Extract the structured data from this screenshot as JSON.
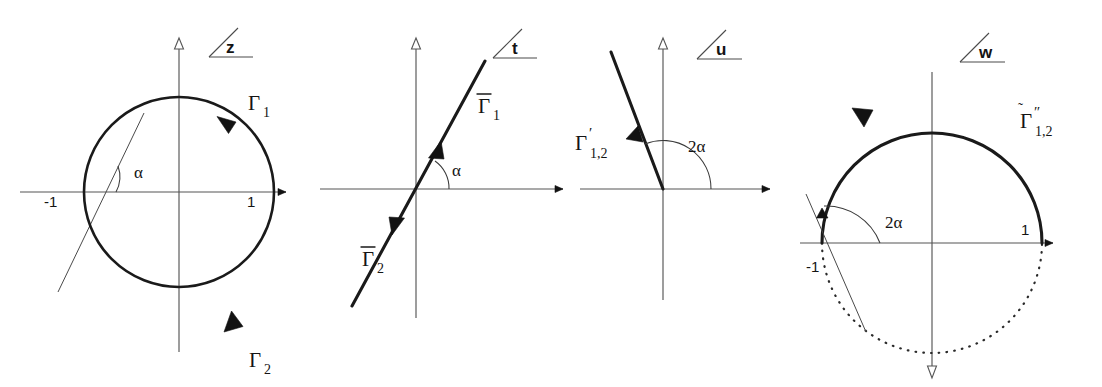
{
  "figure": {
    "background": "#ffffff",
    "ink_color": "#141414",
    "axis_color": "#555555"
  },
  "panels": [
    {
      "id": "z-plane",
      "plane_label": "z",
      "plane_mark": "angle-wedge",
      "geometry": "unit-circle",
      "origin": {
        "x": 179,
        "y": 192
      },
      "radius": 95,
      "axis_points": [
        "-1",
        "1"
      ],
      "angle_label": "α",
      "curves": [
        {
          "name": "Γ",
          "sub": "1",
          "arc": "upper-right",
          "direction": "clockwise"
        },
        {
          "name": "Γ",
          "sub": "2",
          "arc": "lower-right",
          "direction": "clockwise"
        }
      ],
      "labels": {
        "gamma1": {
          "base": "Γ",
          "sub": "1"
        },
        "gamma2": {
          "base": "Γ",
          "sub": "2"
        },
        "left_point": "-1",
        "right_point": "1",
        "angle": "α"
      },
      "tangent_line": true
    },
    {
      "id": "t-plane",
      "plane_label": "t",
      "plane_mark": "angle-wedge",
      "geometry": "straight-line",
      "origin": {
        "x": 416,
        "y": 189
      },
      "line_angle_deg": 55,
      "angle_label": "α",
      "curves": [
        {
          "name": "Γ̄",
          "sub": "1",
          "ray": "upper-right",
          "direction": "outward"
        },
        {
          "name": "Γ̄",
          "sub": "2",
          "ray": "lower-left",
          "direction": "outward"
        }
      ],
      "labels": {
        "gamma1": {
          "base": "Γ",
          "sub": "1",
          "accent": "bar"
        },
        "gamma2": {
          "base": "Γ",
          "sub": "2",
          "accent": "bar"
        },
        "angle": "α"
      }
    },
    {
      "id": "u-plane",
      "plane_label": "u",
      "plane_mark": "angle-wedge",
      "geometry": "single-ray",
      "origin": {
        "x": 663,
        "y": 189
      },
      "ray_angle_deg": 112,
      "angle_label": "2α",
      "curves": [
        {
          "name": "Γ′",
          "sub": "1,2",
          "ray": "upper-left",
          "direction": "outward"
        }
      ],
      "labels": {
        "gamma": {
          "base": "Γ",
          "sub": "1,2",
          "accent": "prime"
        },
        "angle": "2α"
      }
    },
    {
      "id": "w-plane",
      "plane_label": "w",
      "plane_mark": "angle-wedge",
      "geometry": "unit-circle-split",
      "origin": {
        "x": 932,
        "y": 243
      },
      "radius": 110,
      "axis_points": [
        "-1",
        "1"
      ],
      "angle_label": "2α",
      "curves": [
        {
          "name": "Γ̃″",
          "sub": "1,2",
          "arc": "upper",
          "direction": "counterclockwise",
          "style": "solid-bold"
        },
        {
          "name": "",
          "sub": "",
          "arc": "lower",
          "direction": "none",
          "style": "dotted"
        }
      ],
      "labels": {
        "gamma": {
          "base": "Γ",
          "sub": "1,2",
          "accent": "tilde-doubleprime"
        },
        "left_point": "-1",
        "right_point": "1",
        "angle": "2α"
      },
      "tangent_line": true,
      "y_axis_direction": "down"
    }
  ],
  "glyphs": {
    "gamma": "Γ",
    "alpha": "α",
    "two_alpha": "2α",
    "prime": "′",
    "double_prime": "″",
    "minus_one": "-1",
    "one": "1"
  },
  "icons": {
    "plane_angle_mark": "angle-wedge-icon",
    "axis_arrow": "axis-arrow-icon",
    "curve_arrow": "curve-direction-arrow-icon"
  }
}
